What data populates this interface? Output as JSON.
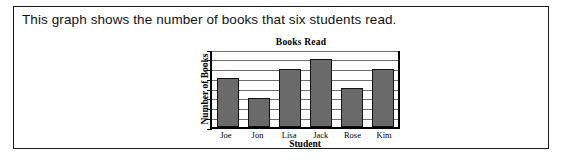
{
  "prompt": {
    "text": "This graph shows the number of books that six students read."
  },
  "colors": {
    "bar_fill": "#6a6a6a",
    "bar_outline": "#111111",
    "gridline": "#6e6e6e",
    "frame": "#000000",
    "box_border": "#1a1a1a",
    "background": "#ffffff"
  },
  "chart_data": {
    "type": "bar",
    "title": "Books Read",
    "xlabel": "Student",
    "ylabel": "Number of Books",
    "categories": [
      "Joe",
      "Jon",
      "Lisa",
      "Jack",
      "Rose",
      "Kim"
    ],
    "values": [
      5,
      3,
      6,
      7,
      4,
      6
    ],
    "ylim": [
      0,
      8
    ],
    "ytick_values": [
      0,
      1,
      2,
      3,
      4,
      5,
      6,
      7,
      8
    ],
    "ytick_labels": [
      "",
      "",
      "",
      "",
      "",
      "",
      "",
      "",
      ""
    ],
    "grid": true,
    "legend": null,
    "legend_position": "none"
  }
}
